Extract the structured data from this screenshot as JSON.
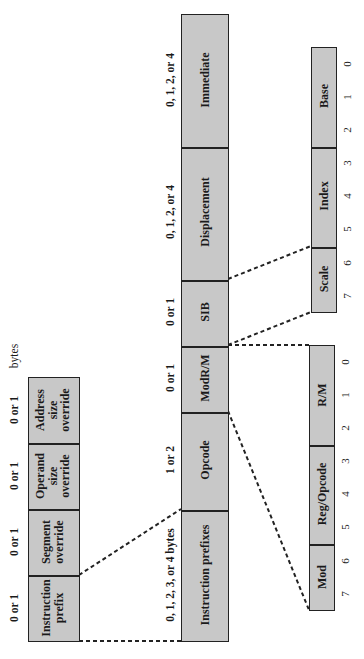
{
  "diagram": {
    "units_label": "bytes",
    "main_fields": [
      {
        "label": "Instruction prefixes",
        "size": "0, 1, 2, 3, or 4 bytes"
      },
      {
        "label": "Opcode",
        "size": "1 or 2"
      },
      {
        "label": "ModR/M",
        "size": "0 or 1"
      },
      {
        "label": "SIB",
        "size": "0 or 1"
      },
      {
        "label": "Displacement",
        "size": "0, 1, 2, or 4"
      },
      {
        "label": "Immediate",
        "size": "0, 1, 2, or 4"
      }
    ],
    "prefix_fields": [
      {
        "line1": "Instruction",
        "line2": "prefix",
        "line3": "",
        "size": "0 or 1"
      },
      {
        "line1": "Segment",
        "line2": "override",
        "line3": "",
        "size": "0 or 1"
      },
      {
        "line1": "Operand",
        "line2": "size",
        "line3": "override",
        "size": "0 or 1"
      },
      {
        "line1": "Address",
        "line2": "size",
        "line3": "override",
        "size": "0 or 1"
      }
    ],
    "modrm_fields": [
      {
        "label": "Mod"
      },
      {
        "label": "Reg/Opcode"
      },
      {
        "label": "R/M"
      }
    ],
    "sib_fields": [
      {
        "label": "Scale"
      },
      {
        "label": "Index"
      },
      {
        "label": "Base"
      }
    ],
    "bit_numbers": [
      "7",
      "6",
      "5",
      "4",
      "3",
      "2",
      "1",
      "0"
    ],
    "colors": {
      "fill": "#c8c8c8",
      "stroke": "#222222",
      "background": "#ffffff"
    }
  }
}
